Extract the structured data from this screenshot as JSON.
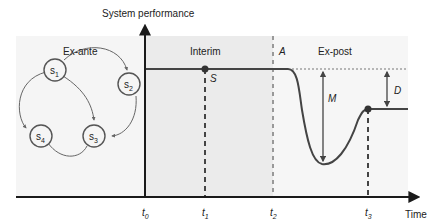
{
  "axes": {
    "y_label": "System performance",
    "x_label": "Time"
  },
  "phases": {
    "ex_ante": "Ex-ante",
    "interim": "Interim",
    "ex_post": "Ex-post"
  },
  "time_ticks": [
    {
      "base": "t",
      "sub": "0"
    },
    {
      "base": "t",
      "sub": "1"
    },
    {
      "base": "t",
      "sub": "2"
    },
    {
      "base": "t",
      "sub": "3"
    }
  ],
  "markers": {
    "S": "S",
    "A": "A",
    "M": "M",
    "D": "D"
  },
  "states": [
    {
      "base": "s",
      "sub": "1"
    },
    {
      "base": "s",
      "sub": "2"
    },
    {
      "base": "s",
      "sub": "3"
    },
    {
      "base": "s",
      "sub": "4"
    }
  ],
  "colors": {
    "background_panel": "#f4f4f4",
    "interim_panel": "#ececec",
    "line": "#444444",
    "axis": "#1a1a1a"
  }
}
